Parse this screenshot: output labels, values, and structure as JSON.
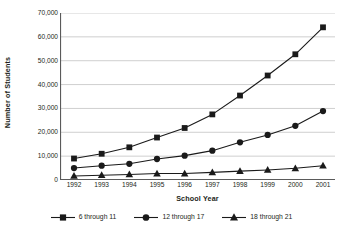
{
  "chart_data": {
    "type": "line",
    "title": "",
    "xlabel": "School Year",
    "ylabel": "Number of Students",
    "categories": [
      "1992",
      "1993",
      "1994",
      "1995",
      "1996",
      "1997",
      "1998",
      "1999",
      "2000",
      "2001"
    ],
    "ylim": [
      0,
      70000
    ],
    "ytick_values": [
      0,
      10000,
      20000,
      30000,
      40000,
      50000,
      60000,
      70000
    ],
    "ytick_labels": [
      "0",
      "10,000",
      "20,000",
      "30,000",
      "40,000",
      "50,000",
      "60,000",
      "70,000"
    ],
    "grid": true,
    "legend_position": "bottom",
    "series": [
      {
        "name": "6 through 11",
        "marker": "square",
        "color": "#1a1a1a",
        "values": [
          9000,
          11000,
          13700,
          17800,
          21800,
          27500,
          35400,
          43800,
          52700,
          64000
        ]
      },
      {
        "name": "12 through 17",
        "marker": "circle",
        "color": "#1a1a1a",
        "values": [
          5000,
          6000,
          6800,
          8800,
          10200,
          12300,
          15800,
          18900,
          22700,
          28900
        ]
      },
      {
        "name": "18 through 21",
        "marker": "triangle",
        "color": "#1a1a1a",
        "values": [
          1700,
          2000,
          2300,
          2700,
          2700,
          3200,
          3700,
          4200,
          4900,
          6000
        ]
      }
    ]
  },
  "legend": {
    "items": [
      {
        "label": "6 through 11",
        "marker": "square"
      },
      {
        "label": "12 through 17",
        "marker": "circle"
      },
      {
        "label": "18 through 21",
        "marker": "triangle"
      }
    ]
  },
  "colors": {
    "series": "#1a1a1a",
    "grid": "#c9c9c9",
    "axis": "#5a5a5a",
    "text": "#231f20",
    "background": "#ffffff"
  }
}
